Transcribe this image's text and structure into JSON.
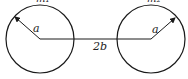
{
  "diagram": {
    "colors": {
      "stroke": "#1a1a1a",
      "background": "#ffffff"
    },
    "circles": [
      {
        "id": "left",
        "cx": 40,
        "cy": 39,
        "r": 34,
        "top_label": "m₁",
        "radius_label": "a"
      },
      {
        "id": "right",
        "cx": 151,
        "cy": 39,
        "r": 34,
        "top_label": "m₂",
        "radius_label": "a"
      }
    ],
    "separation_label": "2b"
  }
}
